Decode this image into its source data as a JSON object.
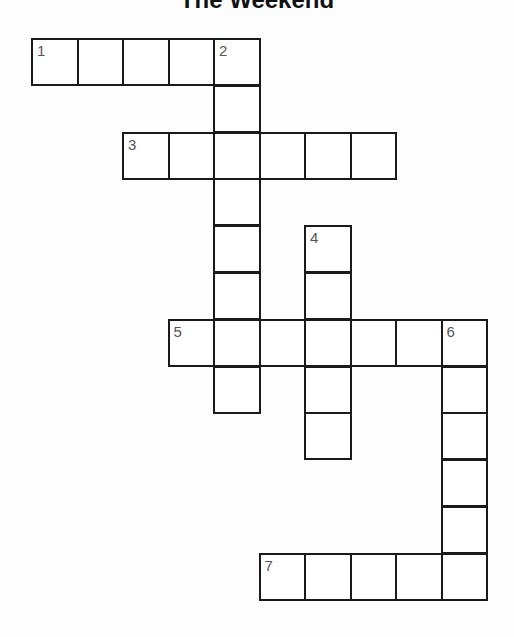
{
  "title": "The Weekend",
  "grid": {
    "origin_x": 31,
    "origin_y": 38,
    "cell_w": 45.5,
    "cell_h": 46.8,
    "line_color": "#1a1a1a",
    "number_color": "#555555"
  },
  "words": [
    {
      "number": "1",
      "direction": "across",
      "row": 0,
      "col": 0,
      "length": 5
    },
    {
      "number": "2",
      "direction": "down",
      "row": 0,
      "col": 4,
      "length": 8
    },
    {
      "number": "3",
      "direction": "across",
      "row": 2,
      "col": 2,
      "length": 6
    },
    {
      "number": "4",
      "direction": "down",
      "row": 4,
      "col": 6,
      "length": 5
    },
    {
      "number": "5",
      "direction": "across",
      "row": 6,
      "col": 3,
      "length": 7
    },
    {
      "number": "6",
      "direction": "down",
      "row": 6,
      "col": 9,
      "length": 6
    },
    {
      "number": "7",
      "direction": "across",
      "row": 11,
      "col": 5,
      "length": 5
    }
  ]
}
